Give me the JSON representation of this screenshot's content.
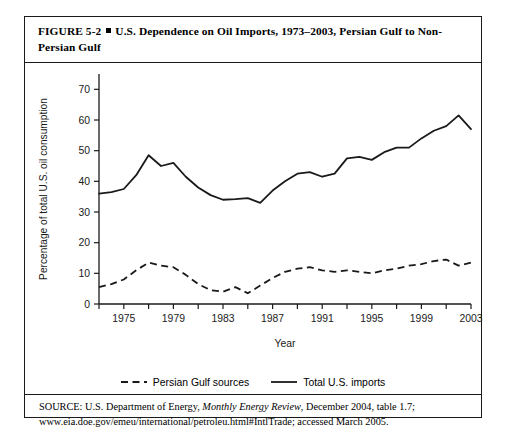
{
  "figure": {
    "number": "FIGURE 5-2",
    "bullet": "square-bullet",
    "title": "U.S. Dependence on Oil Imports, 1973–2003, Persian Gulf to Non-Persian Gulf"
  },
  "source": {
    "prefix": "SOURCE: U.S. Department of Energy, ",
    "publication": "Monthly Energy Review",
    "suffix": ", December 2004, table 1.7;",
    "line2": "www.eia.doe.gov/emeu/international/petroleu.html#IntlTrade; accessed March 2005."
  },
  "legend": {
    "items": [
      {
        "label": "Persian Gulf sources",
        "style": "dashed"
      },
      {
        "label": "Total U.S. imports",
        "style": "solid"
      }
    ]
  },
  "chart_data": {
    "type": "line",
    "title": "",
    "xlabel": "Year",
    "ylabel": "Percentage of total U.S. oil consumption",
    "xlim": [
      1973,
      2003
    ],
    "ylim": [
      0,
      75
    ],
    "yticks": [
      0,
      10,
      20,
      30,
      40,
      50,
      60,
      70
    ],
    "ytick_labels": [
      "0",
      "10",
      "20",
      "30",
      "40",
      "50",
      "60",
      "70"
    ],
    "xticks": [
      1973,
      1975,
      1977,
      1979,
      1981,
      1983,
      1985,
      1987,
      1989,
      1991,
      1993,
      1995,
      1997,
      1999,
      2001,
      2003
    ],
    "xtick_labels": [
      "1975",
      "1979",
      "1983",
      "1987",
      "1991",
      "1995",
      "1999",
      "2003"
    ],
    "xtick_label_years": [
      1975,
      1979,
      1983,
      1987,
      1991,
      1995,
      1999,
      2003
    ],
    "grid": false,
    "legend_position": "below",
    "line_color": "#1a1a1a",
    "x": [
      1973,
      1974,
      1975,
      1976,
      1977,
      1978,
      1979,
      1980,
      1981,
      1982,
      1983,
      1984,
      1985,
      1986,
      1987,
      1988,
      1989,
      1990,
      1991,
      1992,
      1993,
      1994,
      1995,
      1996,
      1997,
      1998,
      1999,
      2000,
      2001,
      2002,
      2003
    ],
    "series": [
      {
        "name": "Total U.S. imports",
        "style": "solid",
        "values": [
          36.0,
          36.5,
          37.5,
          42.0,
          48.5,
          45.0,
          46.0,
          41.5,
          38.0,
          35.5,
          34.0,
          34.2,
          34.5,
          33.0,
          37.0,
          40.0,
          42.5,
          43.0,
          41.5,
          42.5,
          47.5,
          48.0,
          47.0,
          49.5,
          51.0,
          51.0,
          54.0,
          56.5,
          58.0,
          61.5,
          57.0
        ]
      },
      {
        "name": "Persian Gulf sources",
        "style": "dashed",
        "values": [
          5.5,
          6.5,
          8.0,
          11.0,
          13.5,
          12.5,
          12.0,
          9.5,
          6.5,
          4.5,
          4.0,
          5.5,
          3.5,
          6.0,
          8.5,
          10.5,
          11.5,
          12.0,
          11.0,
          10.5,
          11.0,
          10.5,
          10.0,
          11.0,
          11.5,
          12.5,
          13.0,
          14.0,
          14.5,
          12.5,
          13.5
        ]
      }
    ]
  }
}
